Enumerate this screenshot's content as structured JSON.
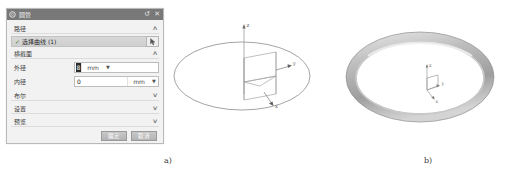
{
  "dialog": {
    "title": "圆管",
    "title_icons": [
      {
        "name": "gear-icon",
        "glyph": "⚙"
      },
      {
        "name": "reset-icon",
        "glyph": "↺"
      },
      {
        "name": "close-icon",
        "glyph": "✕"
      }
    ],
    "groups": {
      "path": {
        "label": "路径",
        "chevron": "∧",
        "selection": {
          "check": "✓",
          "label": "选择曲线 (1)",
          "button_icon": "cursor-select-icon",
          "button_glyph": "↖"
        }
      },
      "cross_section": {
        "label": "横截面",
        "chevron": "∧",
        "params": [
          {
            "label": "外径",
            "value": "8",
            "value_selected": true,
            "unit": "mm",
            "caret": "▼"
          },
          {
            "label": "内径",
            "value": "0",
            "value_selected": false,
            "unit": "mm",
            "caret": "▼"
          }
        ]
      },
      "boolean": {
        "label": "布尔",
        "chevron": "∨"
      },
      "settings": {
        "label": "设置",
        "chevron": "∨"
      },
      "preview": {
        "label": "预览",
        "chevron": "∨"
      }
    },
    "footer": {
      "ok_label": "确定",
      "cancel_label": "取消"
    }
  },
  "viewport_a": {
    "name": "path-and-section-preview",
    "axis_labels": {
      "z": "z",
      "y": "y",
      "x": "x"
    },
    "elements": [
      "circular-path-ellipse",
      "csys-triad",
      "rectangular-section-outline"
    ]
  },
  "viewport_b": {
    "name": "tube-result-preview",
    "axis_labels": {
      "z": "z",
      "y": "y",
      "x": "x"
    },
    "elements": [
      "shaded-torus",
      "csys-triad"
    ]
  },
  "captions": {
    "a": "a)",
    "b": "b)"
  },
  "colors": {
    "titlebar": "#787878",
    "dialog_bg": "#f2f2f2",
    "selection_row": "#d5d5d5",
    "torus_gray": "#b6b6b6",
    "line_gray": "#9a9a9a"
  }
}
